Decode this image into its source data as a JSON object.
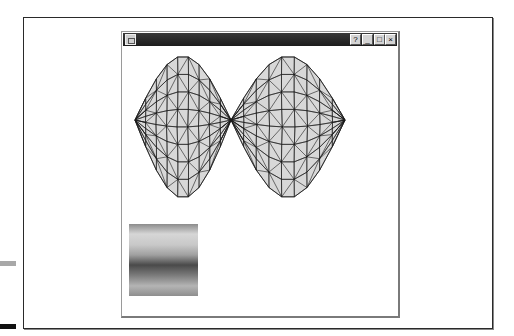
{
  "window": {
    "title": "",
    "buttons": {
      "help": "?",
      "minimize": "_",
      "maximize": "□",
      "close": "×"
    }
  },
  "mesh": {
    "fill": "#d8d8d8",
    "stroke": "#1a1a1a",
    "description": "Triangulated wireframe surface with two lobes meeting at a central pinch point"
  },
  "gradient_swatch": {
    "stops": [
      "#8c8c8c",
      "#d6d6d6",
      "#c8c8c8",
      "#a0a0a0",
      "#4a4a4a",
      "#7a7a7a",
      "#b4b4b4",
      "#8e8e8e"
    ]
  }
}
